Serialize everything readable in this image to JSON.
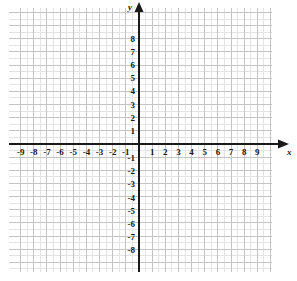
{
  "chart_data": {
    "type": "scatter",
    "title": "",
    "subtitle": "",
    "xlabel": "x",
    "ylabel": "y",
    "xlim": [
      -9.9,
      10.1
    ],
    "ylim": [
      -9.75,
      10.35
    ],
    "grid": true,
    "minor_grid": true,
    "legend": null,
    "series": [],
    "x_tick_labels": [
      "-9",
      "-8",
      "-7",
      "-6",
      "-5",
      "-4",
      "-3",
      "-2",
      "-1",
      "1",
      "2",
      "3",
      "4",
      "5",
      "6",
      "7",
      "8",
      "9"
    ],
    "x_tick_values": [
      -9,
      -8,
      -7,
      -6,
      -5,
      -4,
      -3,
      -2,
      -1,
      1,
      2,
      3,
      4,
      5,
      6,
      7,
      8,
      9
    ],
    "y_tick_labels": [
      "8",
      "7",
      "6",
      "5",
      "4",
      "3",
      "2",
      "1",
      "-1",
      "-2",
      "-3",
      "-4",
      "-5",
      "-6",
      "-7",
      "-8"
    ],
    "y_tick_values": [
      8,
      7,
      6,
      5,
      4,
      3,
      2,
      1,
      -1,
      -2,
      -3,
      -4,
      -5,
      -6,
      -7,
      -8
    ],
    "origin_label": "",
    "annotations": []
  },
  "style": {
    "axis_color": "#1a1a1a",
    "grid_major_color": "#c4c4c4",
    "grid_minor_color": "#e4e4e4",
    "background_color": "#ffffff",
    "label_color": "#1a1a1a"
  },
  "geometry": {
    "origin_x": 139,
    "origin_y": 144,
    "unit": 13.15,
    "grid_left": 9,
    "grid_top": 8,
    "grid_right": 272,
    "grid_bottom": 272,
    "x_axis_arrow": "right",
    "y_axis_arrow": "up"
  },
  "axis_names": {
    "x": "x",
    "y": "y"
  }
}
